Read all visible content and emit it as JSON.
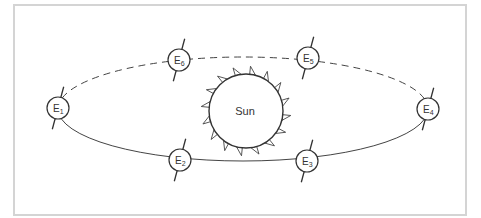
{
  "diagram": {
    "sun": {
      "label": "Sun",
      "cx": 246,
      "cy": 111,
      "r": 37,
      "ray_count": 16
    },
    "orbit": {
      "cx": 243,
      "cy": 109,
      "rx": 185,
      "ry": 52,
      "upper_style": "dashed",
      "lower_style": "solid"
    },
    "earths": [
      {
        "id": "E1",
        "base": "E",
        "sub": "1",
        "cx": 58,
        "cy": 108
      },
      {
        "id": "E2",
        "base": "E",
        "sub": "2",
        "cx": 180,
        "cy": 160
      },
      {
        "id": "E3",
        "base": "E",
        "sub": "3",
        "cx": 307,
        "cy": 161
      },
      {
        "id": "E4",
        "base": "E",
        "sub": "4",
        "cx": 428,
        "cy": 109
      },
      {
        "id": "E5",
        "base": "E",
        "sub": "5",
        "cx": 308,
        "cy": 58
      },
      {
        "id": "E6",
        "base": "E",
        "sub": "6",
        "cx": 179,
        "cy": 60
      }
    ],
    "colors": {
      "line": "#333333",
      "frame": "#d4d4d4",
      "background": "#ffffff"
    }
  }
}
